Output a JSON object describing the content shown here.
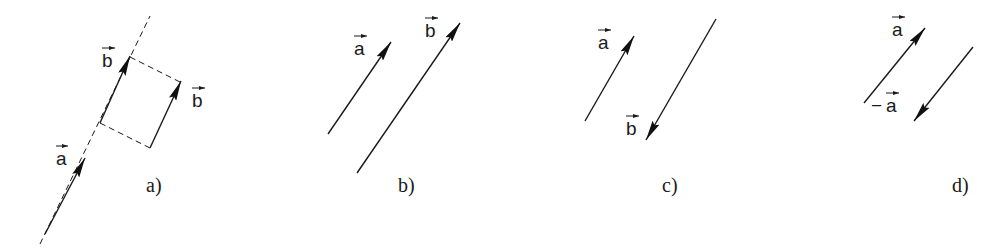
{
  "figure": {
    "panels": [
      {
        "id": "a",
        "caption": "a)",
        "labels": [
          {
            "text": "a",
            "prefix": "",
            "x": 56,
            "y": 165
          },
          {
            "text": "b",
            "prefix": "",
            "x": 102,
            "y": 67
          },
          {
            "text": "b",
            "prefix": "",
            "x": 192,
            "y": 107
          }
        ],
        "caption_pos": {
          "x": 146,
          "y": 192
        }
      },
      {
        "id": "b",
        "caption": "b)",
        "labels": [
          {
            "text": "a",
            "prefix": "",
            "x": 354,
            "y": 55
          },
          {
            "text": "b",
            "prefix": "",
            "x": 425,
            "y": 37
          }
        ],
        "caption_pos": {
          "x": 398,
          "y": 192
        }
      },
      {
        "id": "c",
        "caption": "c)",
        "labels": [
          {
            "text": "a",
            "prefix": "",
            "x": 598,
            "y": 49
          },
          {
            "text": "b",
            "prefix": "",
            "x": 626,
            "y": 135
          }
        ],
        "caption_pos": {
          "x": 662,
          "y": 192
        }
      },
      {
        "id": "d",
        "caption": "d)",
        "labels": [
          {
            "text": "a",
            "prefix": "",
            "x": 892,
            "y": 36
          },
          {
            "text": "a",
            "prefix": "−",
            "x": 884,
            "y": 112
          }
        ],
        "caption_pos": {
          "x": 952,
          "y": 192
        }
      }
    ]
  }
}
